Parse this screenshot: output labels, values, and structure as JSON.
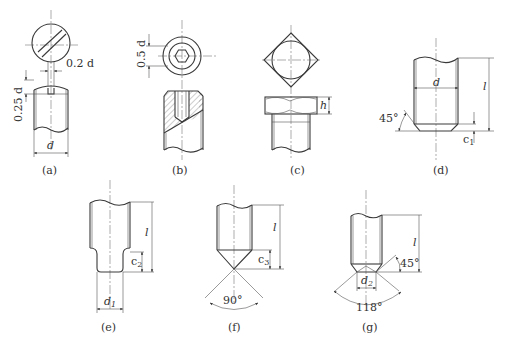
{
  "figure": {
    "panels": [
      {
        "id": "a",
        "caption": "(a)",
        "type": "slotted-head",
        "dimensions": [
          "0.2 d",
          "0.25 d",
          "d"
        ]
      },
      {
        "id": "b",
        "caption": "(b)",
        "type": "hex-socket",
        "dimensions": [
          "0.5 d"
        ]
      },
      {
        "id": "c",
        "caption": "(c)",
        "type": "square-head",
        "dimensions": [
          "h"
        ]
      },
      {
        "id": "d",
        "caption": "(d)",
        "type": "flat-point-chamfer",
        "dimensions": [
          "d",
          "l",
          "45°",
          "c1"
        ]
      },
      {
        "id": "e",
        "caption": "(e)",
        "type": "dog-point",
        "dimensions": [
          "l",
          "c2",
          "d1"
        ]
      },
      {
        "id": "f",
        "caption": "(f)",
        "type": "cone-point",
        "dimensions": [
          "l",
          "c3",
          "90°"
        ]
      },
      {
        "id": "g",
        "caption": "(g)",
        "type": "cup-point",
        "dimensions": [
          "l",
          "45°",
          "d2",
          "118°"
        ]
      }
    ]
  },
  "labels": {
    "a": {
      "caption": "(a)",
      "slot": "0.2 d",
      "depth": "0.25 d",
      "dia": "d"
    },
    "b": {
      "caption": "(b)",
      "socket": "0.5 d"
    },
    "c": {
      "caption": "(c)",
      "height": "h"
    },
    "d": {
      "caption": "(d)",
      "dia": "d",
      "len": "l",
      "angle": "45°",
      "chamfer": "c",
      "chamfer_sub": "1"
    },
    "e": {
      "caption": "(e)",
      "len": "l",
      "step": "c",
      "step_sub": "2",
      "dia": "d",
      "dia_sub": "1"
    },
    "f": {
      "caption": "(f)",
      "len": "l",
      "cone": "c",
      "cone_sub": "3",
      "angle": "90°"
    },
    "g": {
      "caption": "(g)",
      "len": "l",
      "angle": "45°",
      "dia": "d",
      "dia_sub": "2",
      "angle2": "118°"
    }
  }
}
